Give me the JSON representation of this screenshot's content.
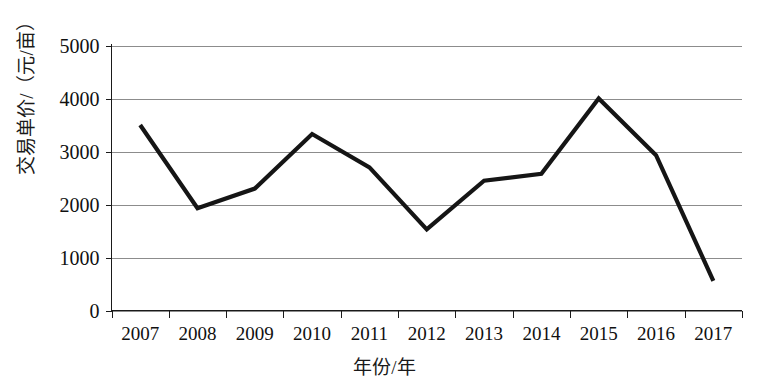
{
  "chart_data": {
    "type": "line",
    "title": "",
    "xlabel": "年份/年",
    "ylabel": "交易单价/（元/亩）",
    "categories": [
      "2007",
      "2008",
      "2009",
      "2010",
      "2011",
      "2012",
      "2013",
      "2014",
      "2015",
      "2016",
      "2017"
    ],
    "values": [
      3500,
      1930,
      2300,
      3330,
      2700,
      1530,
      2450,
      2580,
      4000,
      2930,
      560
    ],
    "series": [
      {
        "name": "交易单价",
        "values": [
          3500,
          1930,
          2300,
          3330,
          2700,
          1530,
          2450,
          2580,
          4000,
          2930,
          560
        ]
      }
    ],
    "ylim": [
      0,
      5000
    ],
    "yticks": [
      0,
      1000,
      2000,
      3000,
      4000,
      5000
    ],
    "ytick_labels": [
      "0",
      "1000",
      "2000",
      "3000",
      "4000",
      "5000"
    ],
    "xtick_labels": [
      "2007",
      "2008",
      "2009",
      "2010",
      "2011",
      "2012",
      "2013",
      "2014",
      "2015",
      "2016",
      "2017"
    ],
    "grid": "horizontal",
    "legend": "none",
    "line_color": "#151515",
    "grid_color": "#8c8c8c",
    "background": "#ffffff"
  }
}
